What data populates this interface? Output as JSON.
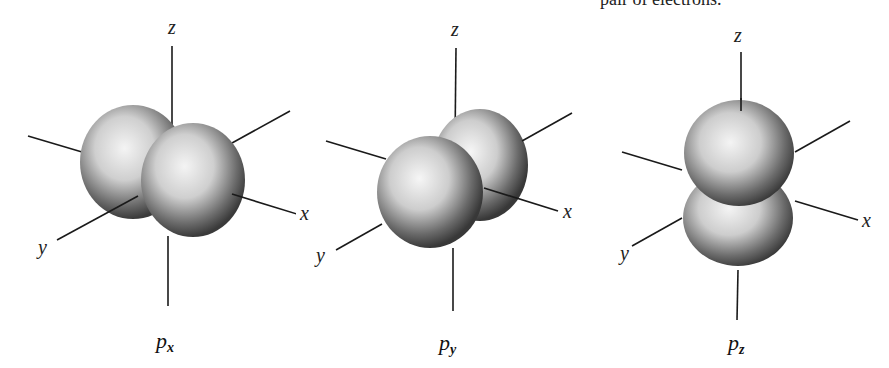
{
  "header_text": "pair of electrons.",
  "panels": [
    {
      "id": "px",
      "caption_main": "p",
      "caption_sub": "x",
      "axis_labels": {
        "z": "z",
        "y": "y",
        "x": "x"
      }
    },
    {
      "id": "py",
      "caption_main": "p",
      "caption_sub": "y",
      "axis_labels": {
        "z": "z",
        "y": "y",
        "x": "x"
      }
    },
    {
      "id": "pz",
      "caption_main": "p",
      "caption_sub": "z",
      "axis_labels": {
        "z": "z",
        "y": "y",
        "x": "x"
      }
    }
  ]
}
